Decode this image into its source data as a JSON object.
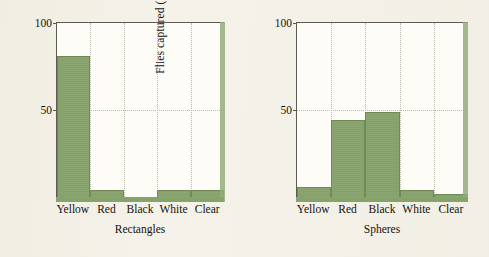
{
  "figure": {
    "background_color": "#f4f1e8",
    "bar_color": "#87a36c",
    "axis_color": "#5b5b53",
    "grid_color": "#b9b9ae"
  },
  "chart_data": [
    {
      "type": "bar",
      "title": "Rectangles",
      "xlabel": "Rectangles",
      "ylabel": "Flies captured (% of total)",
      "categories": [
        "Yellow",
        "Red",
        "Black",
        "White",
        "Clear"
      ],
      "values": [
        81,
        4,
        0,
        4,
        4
      ],
      "ylim": [
        0,
        100
      ],
      "yticks": [
        50,
        100
      ],
      "ytick_labels": [
        "50",
        "100"
      ],
      "grid": "dotted vertical at category boundaries, dotted horizontal at 50",
      "legend": "none",
      "series_name": "Flies captured"
    },
    {
      "type": "bar",
      "title": "Spheres",
      "xlabel": "Spheres",
      "ylabel": "Flies captured (% of total)",
      "categories": [
        "Yellow",
        "Red",
        "Black",
        "White",
        "Clear"
      ],
      "values": [
        6,
        44,
        49,
        4,
        1.5
      ],
      "ylim": [
        0,
        100
      ],
      "yticks": [
        50,
        100
      ],
      "ytick_labels": [
        "50",
        "100"
      ],
      "grid": "dotted vertical at category boundaries, dotted horizontal at 50",
      "legend": "none",
      "series_name": "Flies captured"
    }
  ],
  "panels": [
    {
      "id": "rectangles",
      "ylabel": "Flies captured (% of total)",
      "caption": "Rectangles",
      "ytick_top": "100",
      "ytick_mid": "50",
      "categories": [
        "Yellow",
        "Red",
        "Black",
        "White",
        "Clear"
      ],
      "values": [
        81,
        4,
        0,
        4,
        4
      ]
    },
    {
      "id": "spheres",
      "ylabel": "Flies captured (% of total)",
      "caption": "Spheres",
      "ytick_top": "100",
      "ytick_mid": "50",
      "categories": [
        "Yellow",
        "Red",
        "Black",
        "White",
        "Clear"
      ],
      "values": [
        6,
        44,
        49,
        4,
        1.5
      ]
    }
  ]
}
